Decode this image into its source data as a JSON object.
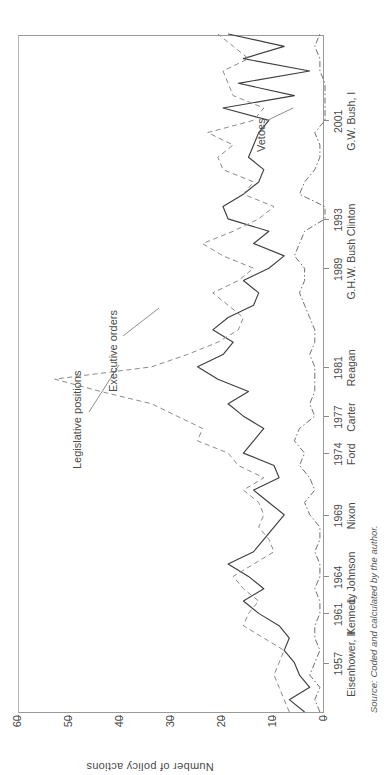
{
  "figure": {
    "y_axis_title": "Number of policy actions",
    "source_note": "Source: Coded and calculated by the author."
  },
  "annotations": [
    {
      "name": "legislative-positions",
      "label": "Legislative positions"
    },
    {
      "name": "executive-orders",
      "label": "Executive orders"
    },
    {
      "name": "vetoes",
      "label": "Vetoes"
    }
  ],
  "chart_data": {
    "type": "line",
    "title": "",
    "xlabel": "",
    "ylabel": "Number of policy actions",
    "ylim": [
      0,
      60
    ],
    "yticks": [
      0,
      10,
      20,
      30,
      40,
      50,
      60
    ],
    "xlim": [
      1953,
      2008
    ],
    "grid": false,
    "legend": "inline annotations",
    "xtick_labels": [
      {
        "year": "1957",
        "president": "Eisenhower, II"
      },
      {
        "year": "1961",
        "president": "Kennedy"
      },
      {
        "year": "1964",
        "president": "L. Johnson"
      },
      {
        "year": "1969",
        "president": "Nixon"
      },
      {
        "year": "1974",
        "president": "Ford"
      },
      {
        "year": "1977",
        "president": "Carter"
      },
      {
        "year": "1981",
        "president": "Reagan"
      },
      {
        "year": "1989",
        "president": "G.H.W. Bush"
      },
      {
        "year": "1993",
        "president": "Clinton"
      },
      {
        "year": "2001",
        "president": "G.W. Bush, I"
      }
    ],
    "x": [
      1953,
      1954,
      1955,
      1956,
      1957,
      1958,
      1959,
      1960,
      1961,
      1962,
      1963,
      1964,
      1965,
      1966,
      1967,
      1968,
      1969,
      1970,
      1971,
      1972,
      1973,
      1974,
      1975,
      1976,
      1977,
      1978,
      1979,
      1980,
      1981,
      1982,
      1983,
      1984,
      1985,
      1986,
      1987,
      1988,
      1989,
      1990,
      1991,
      1992,
      1993,
      1994,
      1995,
      1996,
      1997,
      1998,
      1999,
      2000,
      2001,
      2002,
      2003,
      2004,
      2005,
      2006,
      2007,
      2008
    ],
    "series": [
      {
        "name": "Executive orders",
        "style": "solid",
        "color": "#3f3f3f",
        "values": [
          4,
          7,
          3,
          5,
          6,
          8,
          7,
          9,
          13,
          16,
          12,
          15,
          19,
          14,
          12,
          10,
          8,
          11,
          14,
          9,
          10,
          16,
          14,
          12,
          16,
          19,
          15,
          21,
          25,
          20,
          18,
          22,
          19,
          14,
          13,
          16,
          11,
          8,
          14,
          11,
          19,
          20,
          16,
          13,
          12,
          15,
          14,
          13,
          11,
          20,
          6,
          17,
          3,
          16,
          8,
          19
        ]
      },
      {
        "name": "Legislative positions",
        "style": "dashed",
        "color": "#8a8a8a",
        "values": [
          7,
          8,
          9,
          10,
          9,
          8,
          12,
          16,
          15,
          13,
          16,
          18,
          14,
          10,
          11,
          13,
          12,
          13,
          16,
          12,
          17,
          19,
          25,
          24,
          29,
          34,
          44,
          53,
          34,
          27,
          21,
          17,
          16,
          19,
          22,
          17,
          14,
          20,
          24,
          18,
          13,
          10,
          16,
          14,
          20,
          21,
          18,
          23,
          14,
          12,
          18,
          19,
          20,
          15,
          18,
          21
        ]
      },
      {
        "name": "Vetoes",
        "style": "dashdot",
        "color": "#6f6f6f",
        "values": [
          1,
          2,
          1,
          3,
          2,
          1,
          2,
          2,
          1,
          1,
          2,
          1,
          1,
          2,
          1,
          1,
          3,
          4,
          2,
          3,
          5,
          4,
          6,
          5,
          2,
          3,
          2,
          2,
          2,
          3,
          2,
          2,
          3,
          4,
          5,
          4,
          4,
          6,
          5,
          4,
          0,
          0,
          5,
          4,
          2,
          1,
          1,
          2,
          0,
          0,
          0,
          0,
          1,
          1,
          2,
          1
        ]
      }
    ]
  }
}
